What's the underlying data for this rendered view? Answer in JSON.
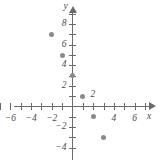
{
  "chart_data": {
    "type": "scatter",
    "title": "",
    "xlabel": "x",
    "ylabel": "y",
    "xlim": [
      -7.2,
      7.2
    ],
    "ylim": [
      -5.2,
      9.4
    ],
    "grid": false,
    "legend": null,
    "x_ticks": [
      -7,
      -6,
      -5,
      -4,
      -3,
      -2,
      -1,
      1,
      2,
      3,
      4,
      5,
      6,
      7
    ],
    "y_ticks": [
      -4,
      -3,
      -2,
      -1,
      1,
      2,
      3,
      4,
      5,
      6,
      7,
      8,
      9
    ],
    "x_tick_labels": [
      {
        "value": -6,
        "text": "−6"
      },
      {
        "value": -4,
        "text": "−4"
      },
      {
        "value": -2,
        "text": "−2"
      },
      {
        "value": 4,
        "text": "4"
      },
      {
        "value": 6,
        "text": "6"
      }
    ],
    "y_tick_labels": [
      {
        "value": 8,
        "text": "8"
      },
      {
        "value": 6,
        "text": "6"
      },
      {
        "value": 4,
        "text": "4"
      },
      {
        "value": 2,
        "text": "2"
      },
      {
        "value": -2,
        "text": "−2"
      },
      {
        "value": -4,
        "text": "−4"
      }
    ],
    "points": [
      {
        "x": -2,
        "y": 7
      },
      {
        "x": -1,
        "y": 5
      },
      {
        "x": 0,
        "y": 3
      },
      {
        "x": 1,
        "y": 1
      },
      {
        "x": 2,
        "y": -1
      },
      {
        "x": 3,
        "y": -3
      }
    ],
    "annotations": [
      {
        "text": "2",
        "x": 1.75,
        "y": 1.15
      }
    ]
  }
}
